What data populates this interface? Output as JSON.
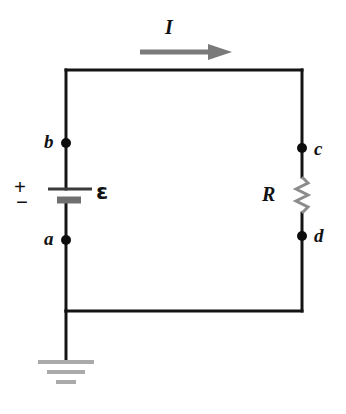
{
  "figure": {
    "kind": "circuit-diagram",
    "background_color": "#ffffff"
  },
  "colors": {
    "wire": "#141414",
    "node_dot": "#0d0d0d",
    "label_text": "#111111",
    "current_arrow": "#7a7a7a",
    "resistor": "#8c8c8c",
    "battery_long_plate": "#3a3a3a",
    "battery_short_plate": "#707070",
    "ground_bars": "#aaaaaa"
  },
  "labels": {
    "current": "I",
    "emf": "ε",
    "resistor": "R",
    "plus": "+",
    "minus": "−",
    "node_a": "a",
    "node_b": "b",
    "node_c": "c",
    "node_d": "d"
  },
  "geometry": {
    "left_wire_x": 66,
    "right_wire_x": 302,
    "top_wire_y": 70,
    "bottom_wire_y": 311,
    "node_a_y": 240,
    "node_b_y": 143,
    "node_c_y": 148,
    "node_d_y": 236,
    "ground_stem_bottom_y": 360,
    "arrow_y": 52,
    "arrow_x_start": 140,
    "arrow_x_tip": 232
  },
  "components": {
    "battery": {
      "name": "emf-source",
      "long_plate_y": 189,
      "long_plate_x1": 48,
      "long_plate_x2": 92,
      "short_plate_y": 200,
      "short_plate_x1": 57,
      "short_plate_x2": 81
    },
    "resistor": {
      "name": "resistor",
      "zigzag_top_y": 177,
      "zigzag_bottom_y": 213,
      "amplitude": 6,
      "segments": 6
    },
    "ground": {
      "name": "ground-symbol",
      "bars": [
        {
          "y": 362,
          "half_width": 28,
          "thickness": 4
        },
        {
          "y": 372,
          "half_width": 19,
          "thickness": 4
        },
        {
          "y": 382,
          "half_width": 10,
          "thickness": 4
        }
      ]
    }
  }
}
